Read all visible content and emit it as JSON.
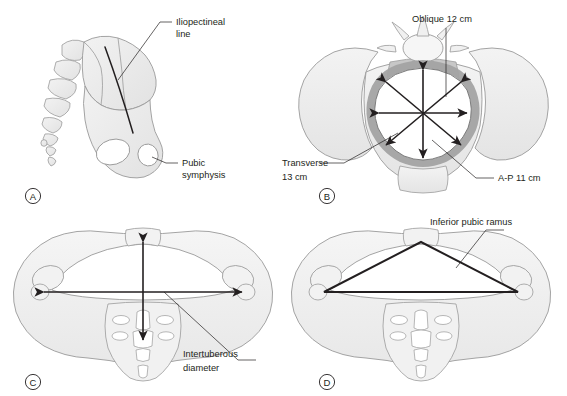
{
  "figure": {
    "background_color": "#ffffff",
    "bone_fill": "#ececec",
    "bone_fill_light": "#f4f4f4",
    "bone_outline": "#9a9a9a",
    "brim_shade": "#a8a8a8",
    "sacrum_shade": "#c9c9c9",
    "line_color": "#231f20",
    "text_color": "#231f20"
  },
  "panels": [
    {
      "id": "A",
      "letter": "A",
      "description": "Lateral view of hemipelvis with sacrum and coccyx",
      "labels": [
        {
          "name": "iliopectineal-line",
          "line1": "Iliopectineal",
          "line2": "line"
        },
        {
          "name": "pubic-symphysis",
          "line1": "Pubic",
          "line2": "symphysis"
        }
      ]
    },
    {
      "id": "B",
      "letter": "B",
      "description": "Pelvic inlet showing inlet diameters",
      "labels": [
        {
          "name": "oblique-diameter",
          "line1": "Oblique 12 cm",
          "line2": ""
        },
        {
          "name": "transverse-diameter",
          "line1": "Transverse",
          "line2": "13 cm"
        },
        {
          "name": "ap-diameter",
          "line1": "A-P 11 cm",
          "line2": ""
        }
      ]
    },
    {
      "id": "C",
      "letter": "C",
      "description": "Pelvic outlet showing intertuberous diameter",
      "labels": [
        {
          "name": "intertuberous-diameter",
          "line1": "Intertuberous",
          "line2": "diameter"
        }
      ]
    },
    {
      "id": "D",
      "letter": "D",
      "description": "Pelvic outlet showing subpubic arch triangle",
      "labels": [
        {
          "name": "inferior-pubic-ramus",
          "line1": "Inferior pubic ramus",
          "line2": ""
        }
      ]
    }
  ],
  "measurements": {
    "oblique": "Oblique 12 cm",
    "transverse_line1": "Transverse",
    "transverse_line2": "13 cm",
    "ap": "A-P 11 cm"
  }
}
